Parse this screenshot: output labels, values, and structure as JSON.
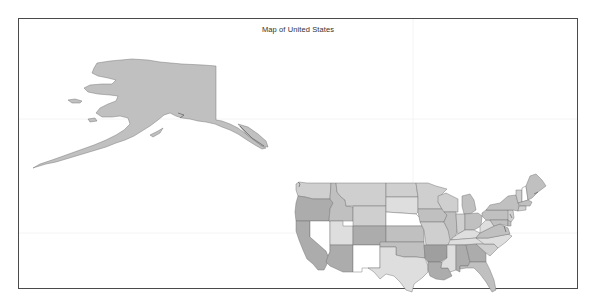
{
  "map": {
    "title": "Map of United States",
    "colors": {
      "frame": "#4a4a4a",
      "border": "#6f6f6f",
      "background": "#ffffff"
    },
    "shades": {
      "white": "#ffffff",
      "light": "#dedede",
      "lightmid": "#cfcfcf",
      "mid": "#c0c0c0",
      "dark": "#acacac",
      "darker": "#9f9f9f"
    },
    "states": {
      "AK": "mid",
      "WA": "lightmid",
      "OR": "dark",
      "CA": "dark",
      "NV": "white",
      "ID": "mid",
      "MT": "lightmid",
      "WY": "lightmid",
      "UT": "light",
      "AZ": "dark",
      "CO": "dark",
      "NM": "white",
      "ND": "lightmid",
      "SD": "light",
      "NE": "white",
      "KS": "mid",
      "OK": "mid",
      "TX": "light",
      "MN": "lightmid",
      "IA": "mid",
      "MO": "lightmid",
      "AR": "darker",
      "LA": "dark",
      "WI": "lightmid",
      "IL": "mid",
      "MI": "mid",
      "IN": "lightmid",
      "OH": "mid",
      "KY": "light",
      "TN": "light",
      "MS": "light",
      "AL": "dark",
      "GA": "dark",
      "FL": "mid",
      "SC": "lightmid",
      "NC": "light",
      "VA": "mid",
      "WV": "light",
      "PA": "mid",
      "NY": "mid",
      "VT": "lightmid",
      "NH": "white",
      "ME": "mid",
      "MA": "mid",
      "CT": "lightmid",
      "NJ": "lightmid",
      "MD": "mid",
      "DE": "mid"
    }
  }
}
